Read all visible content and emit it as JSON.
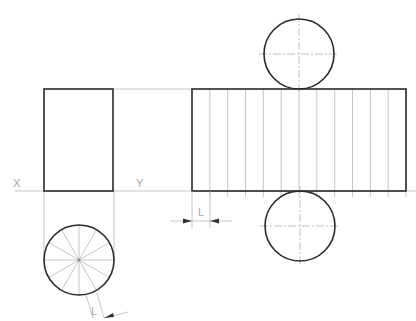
{
  "diagram": {
    "type": "orthographic-projection-with-development",
    "labels": {
      "x_axis": "X",
      "y_axis": "Y",
      "development_segment": "L",
      "circle_segment": "L"
    },
    "front_view": {
      "shape": "rectangle",
      "x": 44,
      "y": 89,
      "width": 69,
      "height": 102
    },
    "top_view": {
      "shape": "circle",
      "cx": 79,
      "cy": 260,
      "r": 35,
      "radial_divisions": 12
    },
    "development": {
      "rectangle": {
        "x": 192,
        "y": 89,
        "width": 214,
        "height": 102
      },
      "vertical_divisions": 12,
      "top_circle": {
        "cx": 299,
        "cy": 54,
        "r": 35
      },
      "bottom_circle": {
        "cx": 299,
        "cy": 226,
        "r": 35
      }
    },
    "xy_line_y": 191,
    "colors": {
      "outline": "#2a2a2a",
      "construction": "#b8b8b8",
      "label": "#a8a8a8"
    }
  }
}
